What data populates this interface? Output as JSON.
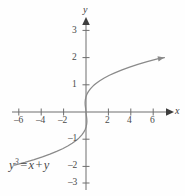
{
  "figure": {
    "background_color": "#fefefe",
    "curve_color": "#8a8a8a",
    "axis_color": "#6e6e6e",
    "label_color": "#4a4a4a"
  },
  "equation": {
    "lhs_base": "y",
    "lhs_exponent": "3",
    "equals": "=",
    "rhs_first": "x",
    "plus": "+",
    "rhs_second": "y"
  },
  "axes": {
    "x_name": "x",
    "y_name": "y",
    "x_ticks": [
      {
        "value": -6,
        "label": "–6"
      },
      {
        "value": -4,
        "label": "–4"
      },
      {
        "value": -2,
        "label": "–2"
      },
      {
        "value": 2,
        "label": "2"
      },
      {
        "value": 4,
        "label": "4"
      },
      {
        "value": 6,
        "label": "6"
      }
    ],
    "y_ticks": [
      {
        "value": 3,
        "label": "3"
      },
      {
        "value": 2,
        "label": "2"
      },
      {
        "value": 1,
        "label": "1"
      },
      {
        "value": -1,
        "label": "–1"
      },
      {
        "value": -2,
        "label": "–2"
      },
      {
        "value": -3,
        "label": "–3"
      }
    ]
  },
  "chart_data": {
    "type": "line",
    "title": "",
    "xlabel": "x",
    "ylabel": "y",
    "annotations": [
      "y^3 = x + y"
    ],
    "xlim": [
      -7.2,
      7.2
    ],
    "ylim": [
      -3.6,
      3.6
    ],
    "grid": false,
    "legend": null,
    "relation": "y^3 = x + y",
    "parametrization": "x = y^3 - y",
    "series": [
      {
        "name": "y^3 = x + y",
        "points": [
          [
            -6.375,
            -1.95
          ],
          [
            -5.46,
            -1.85
          ],
          [
            -4.63,
            -1.75
          ],
          [
            -3.89,
            -1.65
          ],
          [
            -3.22,
            -1.55
          ],
          [
            -2.62,
            -1.45
          ],
          [
            -2.09,
            -1.35
          ],
          [
            -1.63,
            -1.25
          ],
          [
            -1.23,
            -1.15
          ],
          [
            -0.89,
            -1.05
          ],
          [
            -0.75,
            -1.0
          ],
          [
            -0.62,
            -0.95
          ],
          [
            -0.39,
            -0.85
          ],
          [
            -0.21,
            -0.75
          ],
          [
            -0.08,
            -0.65
          ],
          [
            0.01,
            -0.55
          ],
          [
            0.06,
            -0.45
          ],
          [
            0.08,
            -0.35
          ],
          [
            0.07,
            -0.25
          ],
          [
            0.04,
            -0.15
          ],
          [
            0.0,
            0.0
          ],
          [
            -0.04,
            0.15
          ],
          [
            -0.07,
            0.25
          ],
          [
            -0.08,
            0.35
          ],
          [
            -0.06,
            0.45
          ],
          [
            -0.01,
            0.55
          ],
          [
            0.08,
            0.65
          ],
          [
            0.21,
            0.75
          ],
          [
            0.39,
            0.85
          ],
          [
            0.62,
            0.95
          ],
          [
            0.75,
            1.0
          ],
          [
            0.89,
            1.05
          ],
          [
            1.23,
            1.15
          ],
          [
            1.63,
            1.25
          ],
          [
            2.09,
            1.35
          ],
          [
            2.62,
            1.45
          ],
          [
            3.22,
            1.55
          ],
          [
            3.89,
            1.65
          ],
          [
            4.63,
            1.75
          ],
          [
            5.46,
            1.85
          ],
          [
            6.375,
            1.95
          ],
          [
            7.0,
            2.0
          ]
        ],
        "color": "#8a8a8a",
        "arrow_end": true,
        "arrow_start": false
      }
    ]
  },
  "geometry": {
    "origin_x": 86,
    "origin_y": 112,
    "unit_x": 11.2,
    "unit_y": 27.2
  }
}
